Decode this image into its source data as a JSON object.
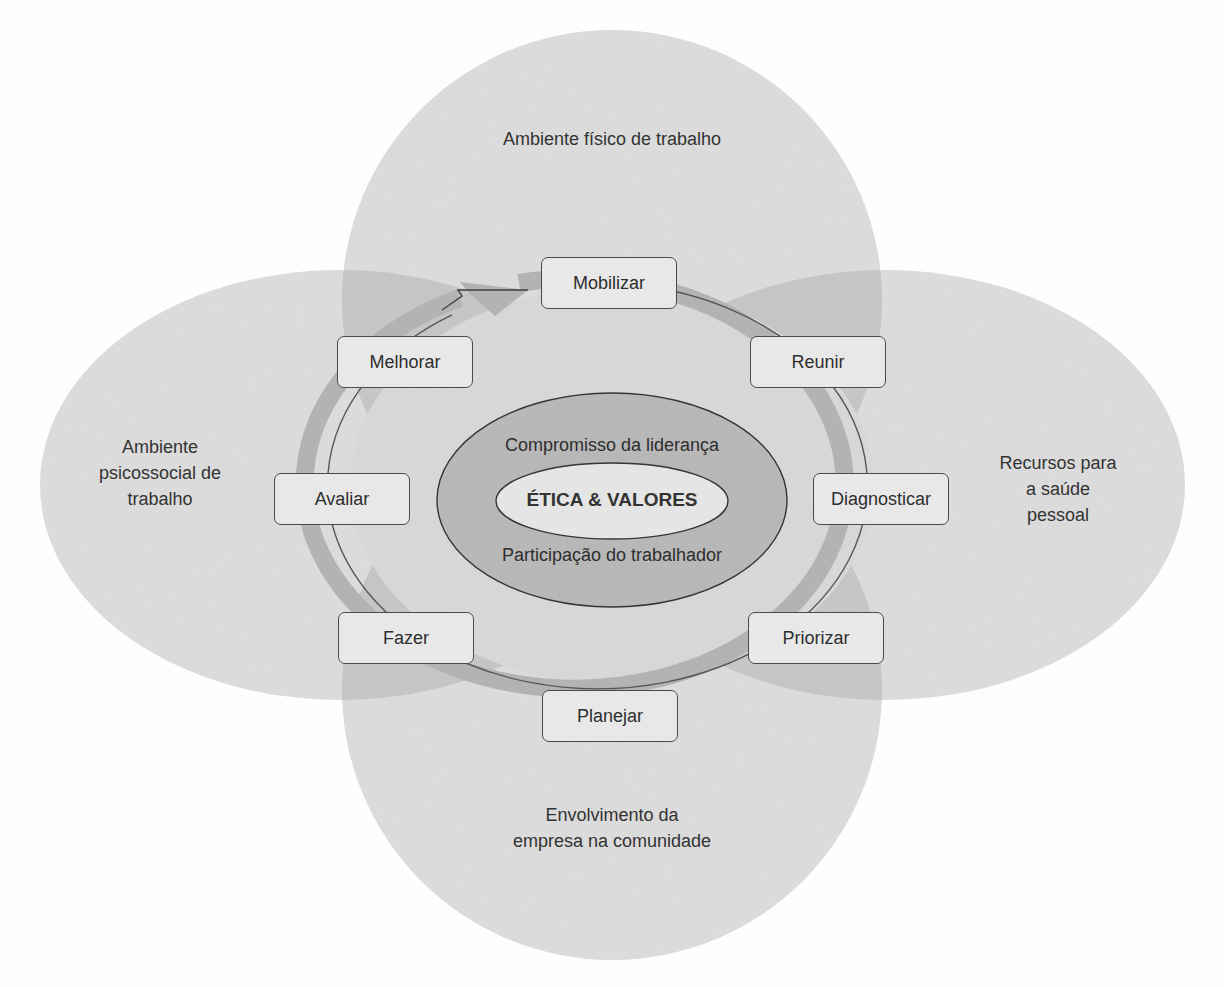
{
  "diagram": {
    "type": "healthy-workplace-model",
    "colors": {
      "background": "#ffffff",
      "outer_area_fill": "#dcdcdc",
      "overlap_fill": "#c4c4c4",
      "ring_fill": "#b3b3b3",
      "core_ellipse_fill": "#b8b8b8",
      "innermost_fill": "#e6e6e6",
      "step_box_fill": "#e8e8e8",
      "stroke": "#4a4a4a"
    },
    "areas": [
      {
        "id": "top",
        "label": "Ambiente físico de trabalho"
      },
      {
        "id": "left",
        "label": "Ambiente\npsicossocial de\ntrabalho"
      },
      {
        "id": "right",
        "label": "Recursos para\na saúde\npessoal"
      },
      {
        "id": "bottom",
        "label": "Envolvimento da\nempresa na comunidade"
      }
    ],
    "cycle_steps": [
      {
        "id": "mobilizar",
        "label": "Mobilizar"
      },
      {
        "id": "reunir",
        "label": "Reunir"
      },
      {
        "id": "diagnosticar",
        "label": "Diagnosticar"
      },
      {
        "id": "priorizar",
        "label": "Priorizar"
      },
      {
        "id": "planejar",
        "label": "Planejar"
      },
      {
        "id": "fazer",
        "label": "Fazer"
      },
      {
        "id": "avaliar",
        "label": "Avaliar"
      },
      {
        "id": "melhorar",
        "label": "Melhorar"
      }
    ],
    "core": {
      "top_label": "Compromisso da liderança",
      "center_label": "ÉTICA & VALORES",
      "bottom_label": "Participação do trabalhador"
    },
    "cycle_direction": "clockwise"
  }
}
